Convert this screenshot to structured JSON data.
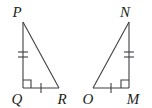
{
  "figure": {
    "type": "geometry-diagram",
    "background_color": "#ffffff",
    "stroke_color": "#3f3f43",
    "label_color": "#231f20",
    "triangles": [
      {
        "name": "triangle-pqr",
        "vertices": [
          {
            "label": "P",
            "x": 23,
            "y": 22,
            "label_x": 17,
            "label_y": 17
          },
          {
            "label": "Q",
            "x": 23,
            "y": 88,
            "label_x": 17,
            "label_y": 103
          },
          {
            "label": "R",
            "x": 59,
            "y": 88,
            "label_x": 57,
            "label_y": 103
          }
        ],
        "right_angle_at": "Q",
        "sides": [
          {
            "name": "PQ",
            "ticks": 2
          },
          {
            "name": "QR",
            "ticks": 1
          },
          {
            "name": "PR",
            "ticks": 0
          }
        ]
      },
      {
        "name": "triangle-nom",
        "vertices": [
          {
            "label": "N",
            "x": 129,
            "y": 22,
            "label_x": 122,
            "label_y": 17
          },
          {
            "label": "O",
            "x": 93,
            "y": 88,
            "label_x": 85,
            "label_y": 103
          },
          {
            "label": "M",
            "x": 129,
            "y": 88,
            "label_x": 127,
            "label_y": 103
          }
        ],
        "right_angle_at": "M",
        "sides": [
          {
            "name": "NM",
            "ticks": 2
          },
          {
            "name": "OM",
            "ticks": 1
          },
          {
            "name": "NO",
            "ticks": 0
          }
        ]
      }
    ]
  },
  "labels": {
    "p": "P",
    "q": "Q",
    "r": "R",
    "n": "N",
    "o": "O",
    "m": "M"
  }
}
